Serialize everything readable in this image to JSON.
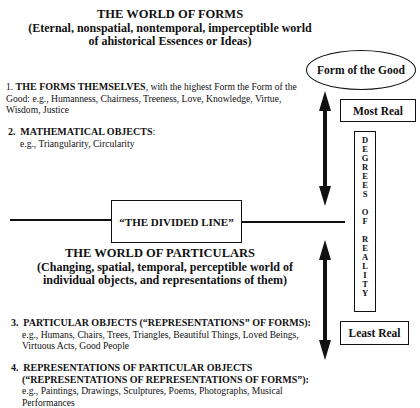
{
  "world_of_forms": {
    "title": "THE WORLD OF FORMS",
    "subtitle_line1": "(Eternal, nonspatial, nontemporal, imperceptible world",
    "subtitle_line2": "of ahistorical Essences or Ideas)"
  },
  "form_of_good": {
    "label": "Form of the Good"
  },
  "items": [
    {
      "number": "1.",
      "heading": "THE FORMS THEMSELVES",
      "line1_rest": ", with the highest Form the Form of the",
      "line2": "Good: e.g., Humanness, Chairness, Treeness, Love, Knowledge, Virtue,",
      "line3": "Wisdom, Justice"
    },
    {
      "number": "2.",
      "heading": "MATHEMATICAL OBJECTS",
      "suffix": ":",
      "line2": "e.g., Triangularity, Circularity"
    },
    {
      "number": "3.",
      "heading": "PARTICULAR OBJECTS  (“REPRESENTATIONS” OF FORMS)",
      "suffix": ":",
      "line2": "e.g., Humans, Chairs, Trees, Triangles, Beautiful Things, Loved Beings,",
      "line3": "Virtuous Acts, Good People"
    },
    {
      "number": "4.",
      "heading": "REPRESENTATIONS OF PARTICULAR OBJECTS",
      "heading2": "(“REPRESENTATIONS OF REPRESENTATIONS OF FORMS”):",
      "line3": "e.g., Paintings, Drawings, Sculptures, Poems, Photographs, Musical",
      "line4": "Performances"
    }
  ],
  "divided_line": {
    "label": "“THE DIVIDED LINE”"
  },
  "world_of_particulars": {
    "title": "THE WORLD OF PARTICULARS",
    "subtitle_line1": "(Changing, spatial, temporal, perceptible world of",
    "subtitle_line2": "individual objects, and representations of them)"
  },
  "scale": {
    "most_real": "Most Real",
    "least_real": "Least Real",
    "degrees_text": "D\nE\nG\nR\nE\nE\nS\n\nO\nF\n\nR\nE\nA\nL\nI\nT\nY"
  },
  "icons": {
    "upper_arrow": "double-headed-vertical-arrow",
    "lower_arrow": "double-headed-vertical-arrow"
  }
}
